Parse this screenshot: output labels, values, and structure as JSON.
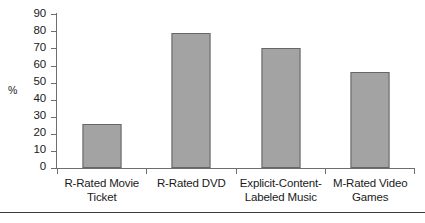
{
  "chart_data": {
    "type": "bar",
    "title": "",
    "xlabel": "",
    "ylabel": "%",
    "categories": [
      "R-Rated Movie Ticket",
      "R-Rated DVD",
      "Explicit-Content-Labeled Music",
      "M-Rated Video Games"
    ],
    "category_lines": [
      [
        "R-Rated Movie",
        "Ticket"
      ],
      [
        "R-Rated DVD",
        ""
      ],
      [
        "Explicit-Content-",
        "Labeled Music"
      ],
      [
        "M-Rated Video",
        "Games"
      ]
    ],
    "values": [
      26,
      79,
      70,
      56
    ],
    "ylim": [
      0,
      90
    ],
    "ytick_step": 10,
    "yticks": [
      90,
      80,
      70,
      60,
      50,
      40,
      30,
      20,
      10,
      0
    ],
    "ytick_labels": [
      "90",
      "80",
      "70",
      "60",
      "50",
      "40",
      "30",
      "20",
      "10",
      "0"
    ],
    "grid": false,
    "legend": false,
    "legend_position": "none",
    "bar_color": "#a3a3a3",
    "bar_edge_color": "#666666",
    "axis_color": "#6e6e6e",
    "text_color": "#1a1a1a",
    "background_color": "#ffffff"
  }
}
